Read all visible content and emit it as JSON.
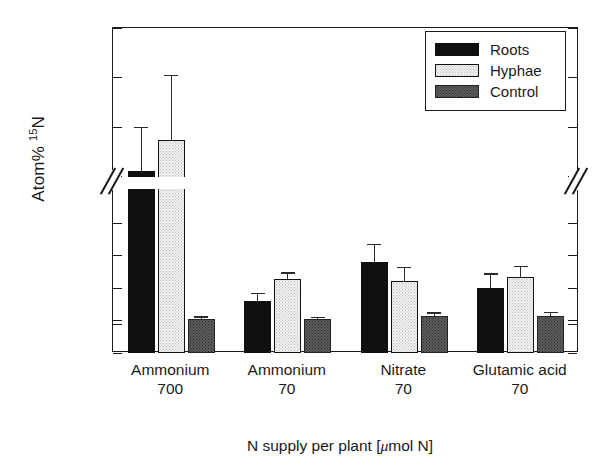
{
  "chart_data": {
    "type": "bar",
    "title": "",
    "xlabel": "N supply per plant [μmol N]",
    "ylabel": "Atom% 15N",
    "ylabel_base": "Atom% ",
    "ylabel_sup": "15",
    "ylabel_tail": "N",
    "broken_axis": true,
    "axis_break_between": [
      0.4,
      0.7
    ],
    "lower_ylim": [
      0.35,
      0.4
    ],
    "upper_ylim": [
      0.7,
      1.0
    ],
    "ytick_labels_lower": [
      "0.35",
      "0.36",
      "0.37",
      "0.38",
      "0.39",
      "0.40"
    ],
    "ytick_labels_upper": [
      "0.70",
      "0.80",
      "0.90",
      "1.00"
    ],
    "grid": false,
    "legend_position": "top-right",
    "categories": [
      "Ammonium 700",
      "Ammonium 70",
      "Nitrate 70",
      "Glutamic acid 70"
    ],
    "category_lines": [
      {
        "name": "Ammonium",
        "dose": "700"
      },
      {
        "name": "Ammonium",
        "dose": "70"
      },
      {
        "name": "Nitrate",
        "dose": "70"
      },
      {
        "name": "Glutamic acid",
        "dose": "70"
      }
    ],
    "series": [
      {
        "name": "Roots",
        "color": "#101010",
        "values": [
          0.71,
          0.366,
          0.378,
          0.37
        ],
        "errors_upper": [
          0.8,
          0.3685,
          0.3835,
          0.3745
        ]
      },
      {
        "name": "Hyphae",
        "color": "#f2f2f2",
        "values": [
          0.773,
          0.3728,
          0.372,
          0.3732
        ],
        "errors_upper": [
          0.905,
          0.3748,
          0.3765,
          0.3768
        ]
      },
      {
        "name": "Control",
        "color": "#5e5e5e",
        "values": [
          0.3603,
          0.3604,
          0.3614,
          0.3615
        ],
        "errors_upper": [
          0.3612,
          0.3611,
          0.3625,
          0.3627
        ]
      }
    ]
  },
  "legend": {
    "items": [
      {
        "label": "Roots",
        "key": "roots"
      },
      {
        "label": "Hyphae",
        "key": "hyphae"
      },
      {
        "label": "Control",
        "key": "control"
      }
    ]
  }
}
